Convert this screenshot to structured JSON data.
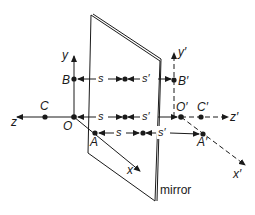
{
  "diagram": {
    "mirror_label": "mirror",
    "object_side": {
      "axes": {
        "x": "x",
        "y": "y",
        "z": "z"
      },
      "points": {
        "origin": "O",
        "B": "B",
        "C": "C",
        "A": "A"
      }
    },
    "image_side": {
      "axes": {
        "x": "x′",
        "y": "y′",
        "z": "z′"
      },
      "points": {
        "origin": "O′",
        "B": "B′",
        "C": "C′",
        "A": "A′"
      }
    },
    "distances": {
      "object": "s",
      "image": "s′"
    },
    "colors": {
      "line": "#1a1a1a",
      "background": "#ffffff"
    }
  }
}
